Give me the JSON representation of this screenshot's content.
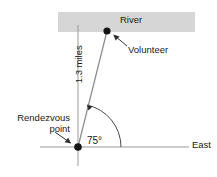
{
  "diagram": {
    "labels": {
      "river": "River",
      "volunteer": "Volunteer",
      "distance": "1.3 miles",
      "rendezvous": "Rendezvous point",
      "angle": "75°",
      "east": "East"
    },
    "colors": {
      "river_fill": "#d6d6d6",
      "line": "#8f8f8f",
      "axis": "#8f8f8f",
      "point": "#1a1a1a",
      "text": "#1a1a1a",
      "background": "#ffffff",
      "leader": "#3a3a3a"
    },
    "geometry": {
      "origin_point": [
        78,
        147
      ],
      "volunteer_point": [
        107,
        31
      ],
      "angle_degrees": 75,
      "distance_value": 1.3,
      "distance_unit": "miles",
      "river_band": {
        "x": 58,
        "y": 12,
        "width": 137,
        "height": 20
      },
      "vertical_axis": {
        "x": 78,
        "y_top": 25,
        "y_bottom": 166
      },
      "horizontal_axis": {
        "y": 147,
        "x_left": 40,
        "x_right": 189
      }
    },
    "icons": {
      "volunteer_marker": "filled-circle-point",
      "rendezvous_marker": "filled-circle-point",
      "volunteer_leader": "arrow-up-left-icon",
      "rendezvous_leader": "arrow-down-right-icon",
      "angle_arc": "angle-arc-arrow-icon"
    }
  }
}
